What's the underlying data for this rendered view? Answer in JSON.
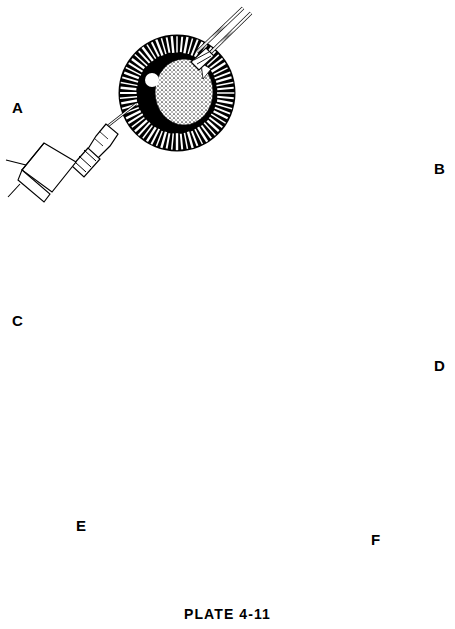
{
  "plate": {
    "caption": "PLATE 4-11",
    "subject": "Phacoemulsification / cataract extraction surgical sequence",
    "background_color": "#ffffff",
    "ink_color": "#000000",
    "iris_grey": "#8f8f8f",
    "nucleus_grey": "#b5b5b5"
  },
  "panels": [
    {
      "id": "A",
      "label": "A",
      "label_x": 12,
      "label_y": 100,
      "eye": {
        "cx": 177,
        "cy": 93,
        "r": 58
      },
      "view": "surgeon-view dilated pupil with ciliary process ring",
      "lens_state": "intact stippled nucleus",
      "instruments": [
        "syringe-with-needle-lower-left",
        "two-shaft-probe-upper-right"
      ],
      "light_reflex": true
    },
    {
      "id": "B",
      "label": "B",
      "label_x": 434,
      "label_y": 161,
      "eye": {
        "cx": 363,
        "cy": 157,
        "r": 52
      },
      "view": "surgeon-view dilated pupil with ciliary process ring",
      "lens_state": "nucleus beginning to fracture",
      "instruments": [
        "syringe-with-needle-lower-left",
        "two-shaft-probe-upper-right"
      ],
      "light_reflex": true
    },
    {
      "id": "C",
      "label": "C",
      "label_x": 12,
      "label_y": 313,
      "eye": {
        "cx": 176,
        "cy": 310,
        "r": 54
      },
      "view": "surgeon-view dilated pupil with ciliary process ring",
      "lens_state": "nucleus fragmented into granular pieces",
      "instruments": [
        "syringe-with-needle-lower-left",
        "two-shaft-probe-upper-right"
      ],
      "light_reflex": true
    },
    {
      "id": "D",
      "label": "D",
      "label_x": 434,
      "label_y": 358,
      "eye": {
        "cx": 369,
        "cy": 362,
        "r": 50
      },
      "view": "surgeon-view dilated pupil with ciliary process ring",
      "lens_state": "residual cortical fragments being aspirated",
      "instruments": [
        "angled-irrigation-aspiration-cannula-lower-left",
        "two-shaft-probe-upper-right"
      ],
      "light_reflex": true
    },
    {
      "id": "E",
      "label": "E",
      "label_x": 76,
      "label_y": 518,
      "eye": {
        "cx": 158,
        "cy": 527,
        "r": 48
      },
      "view": "external view, textured iris annulus with black pupil",
      "lens_state": "implant / aspiration through limbal wound",
      "instruments": [
        "irrigation-tubing-upper-right",
        "shaft-instrument-lower-left"
      ],
      "light_reflex": true,
      "window_reflex_panes": 4
    },
    {
      "id": "F",
      "label": "F",
      "label_x": 371,
      "label_y": 532,
      "eye": {
        "cx": 309,
        "cy": 539,
        "r": 51
      },
      "view": "external view, closed eye after surgery",
      "lens_state": "procedure complete",
      "instruments": [],
      "light_reflex": true,
      "window_reflex_panes": 4,
      "sutures": [
        {
          "name": "suture-knot-superior",
          "x": 311,
          "y": 492
        },
        {
          "name": "suture-knot-inferior",
          "x": 307,
          "y": 588
        }
      ]
    }
  ],
  "icons": {
    "syringe": "syringe-icon",
    "cannula": "cannula-icon",
    "probe": "probe-icon",
    "suture": "suture-knot-icon",
    "light_reflex": "light-reflex-icon"
  }
}
